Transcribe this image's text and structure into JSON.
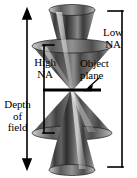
{
  "figure": {
    "type": "optics-diagram",
    "background_color": "#ffffff",
    "ink_color": "#000000",
    "width_px": 137,
    "height_px": 178
  },
  "labels": {
    "low_na": {
      "line1": "Low",
      "line2": "NA"
    },
    "object_plane": {
      "line1": "Object",
      "line2": "plane"
    },
    "high_na": {
      "line1": "High",
      "line2": "NA"
    },
    "depth_of_field": {
      "line1": "Depth",
      "line2": "of",
      "line3": "field"
    }
  },
  "annotations": {
    "depth_arrow": {
      "name": "depth-of-field-double-arrow",
      "orientation": "vertical",
      "x_px": 27,
      "y_top_px": 12,
      "y_bottom_px": 166,
      "arrowheads": "both-ends"
    },
    "low_na_bracket": {
      "name": "low-na-bracket",
      "side": "right",
      "x_px": 122,
      "y_top_px": 12,
      "y_bottom_px": 166,
      "tick_length_px": 14
    },
    "high_na_bracket": {
      "name": "high-na-bracket",
      "side": "left",
      "x_px": 44,
      "y_top_px": 45,
      "y_bottom_px": 132,
      "tick_length_px": 10
    },
    "object_plane_line": {
      "name": "object-plane-line",
      "x_left_px": 43,
      "x_right_px": 101,
      "y_px": 90,
      "thickness_px": 3
    },
    "object_plane_pointer": {
      "name": "object-plane-pointer-arrow",
      "from_x_px": 99,
      "from_y_px": 79,
      "to_x_px": 86,
      "to_y_px": 89
    }
  },
  "cones": {
    "description": "Two crossed light cones (high-NA wide cone and low-NA narrow cone) meeting at the object plane focus point.",
    "focus_point": {
      "x_px": 72,
      "y_px": 90
    },
    "low_na": {
      "name": "low-na-cone",
      "half_width_top_px": 24,
      "top_y_px": 10,
      "bottom_y_px": 170,
      "shading": "gray-gradient"
    },
    "high_na": {
      "name": "high-na-cone",
      "half_width_top_px": 42,
      "top_y_px": 45,
      "bottom_y_px": 134,
      "shading": "gray-gradient"
    }
  },
  "colors": {
    "ink": "#000000",
    "cone_dark": "#2a2a2a",
    "cone_mid": "#6e6e6e",
    "cone_light": "#d8d8d8",
    "cone_highlight": "#f2f2f2",
    "paper": "#ffffff"
  }
}
